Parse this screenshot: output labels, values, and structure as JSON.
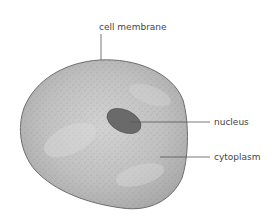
{
  "diagram": {
    "labels": {
      "membrane": "cell membrane",
      "nucleus": "nucleus",
      "cytoplasm": "cytoplasm"
    },
    "colors": {
      "cell_fill": "#bdbdbd",
      "cell_outline": "#6e6e6e",
      "nucleus_fill": "#6a6a6a",
      "leader_line": "#555555",
      "label_text": "#444444"
    }
  }
}
